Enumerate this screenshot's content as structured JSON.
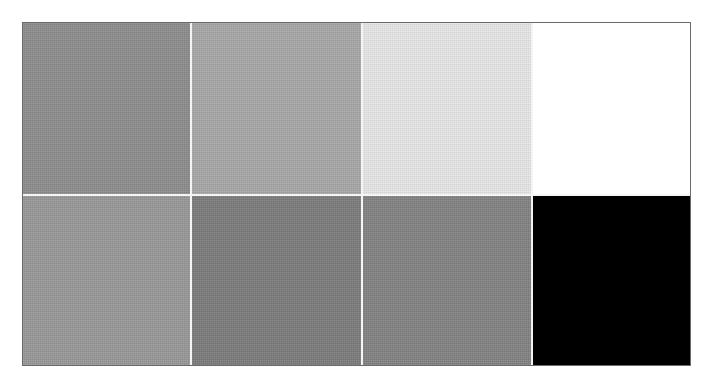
{
  "figure": {
    "type": "grayscale-swatch-grid",
    "rows": 2,
    "columns": 4,
    "border_color": "#6a6a6a",
    "divider_color": "#f4f4f4",
    "swatches": [
      {
        "row": 1,
        "col": 1,
        "color": "#8e8e8e",
        "label": ""
      },
      {
        "row": 1,
        "col": 2,
        "color": "#a9a9a9",
        "label": ""
      },
      {
        "row": 1,
        "col": 3,
        "color": "#e8e8e8",
        "label": ""
      },
      {
        "row": 1,
        "col": 4,
        "color": "#ffffff",
        "label": ""
      },
      {
        "row": 2,
        "col": 1,
        "color": "#999999",
        "label": ""
      },
      {
        "row": 2,
        "col": 2,
        "color": "#7d7d7d",
        "label": ""
      },
      {
        "row": 2,
        "col": 3,
        "color": "#838383",
        "label": ""
      },
      {
        "row": 2,
        "col": 4,
        "color": "#000000",
        "label": ""
      }
    ]
  }
}
